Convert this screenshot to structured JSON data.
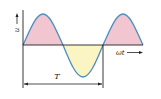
{
  "diagram": {
    "y_axis_label": "u",
    "x_axis_label": "ωt",
    "period_label": "T",
    "colors": {
      "curve": "#4a8fc0",
      "positive_fill": "#f2c6d0",
      "negative_fill": "#fbf5c4",
      "axis": "#222222"
    }
  }
}
